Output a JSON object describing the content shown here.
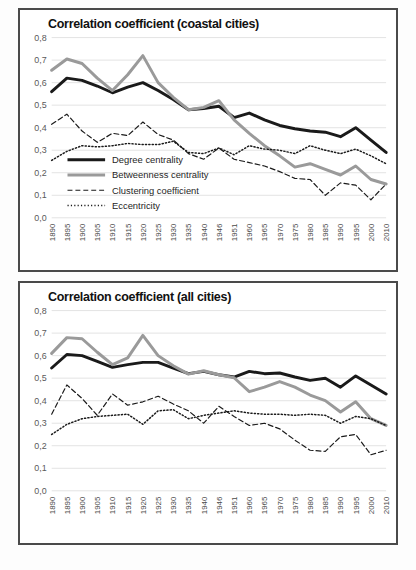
{
  "page": {
    "background": "#fdfdfd",
    "panel_border_color": "#4a4a4a"
  },
  "colors": {
    "degree": "#1a1a1a",
    "betweenness": "#9a9a9a",
    "clustering": "#1a1a1a",
    "eccentricity": "#1a1a1a",
    "grid": "#e3e3e3",
    "axis_text": "#5a5a5a"
  },
  "legend": {
    "items": [
      {
        "label": "Degree centrality",
        "style": "solid-thick",
        "color": "#1a1a1a"
      },
      {
        "label": "Betweenness centrality",
        "style": "solid-thick",
        "color": "#9a9a9a"
      },
      {
        "label": "Clustering coefficient",
        "style": "dashed",
        "color": "#1a1a1a"
      },
      {
        "label": "Eccentricity",
        "style": "dotted",
        "color": "#1a1a1a"
      }
    ]
  },
  "chart_data": [
    {
      "type": "line",
      "title": "Correlation coefficient (coastal cities)",
      "xlabel": "",
      "ylabel": "",
      "ylim": [
        0.0,
        0.8
      ],
      "yticks": [
        0.0,
        0.1,
        0.2,
        0.3,
        0.4,
        0.5,
        0.6,
        0.7,
        0.8
      ],
      "ytick_labels": [
        "0,0",
        "0,1",
        "0,2",
        "0,3",
        "0,4",
        "0,5",
        "0,6",
        "0,7",
        "0,8"
      ],
      "grid": true,
      "legend_position": "inside-lower-left",
      "categories": [
        "1890",
        "1895",
        "1900",
        "1905",
        "1910",
        "1915",
        "1920",
        "1925",
        "1930",
        "1935",
        "1940",
        "1946",
        "1951",
        "1960",
        "1965",
        "1970",
        "1975",
        "1980",
        "1985",
        "1990",
        "1995",
        "2000",
        "2010"
      ],
      "series": [
        {
          "name": "Degree centrality",
          "values": [
            0.56,
            0.62,
            0.61,
            0.585,
            0.555,
            0.58,
            0.6,
            0.565,
            0.525,
            0.48,
            0.485,
            0.495,
            0.445,
            0.465,
            0.435,
            0.41,
            0.395,
            0.385,
            0.38,
            0.36,
            0.4,
            0.345,
            0.29
          ]
        },
        {
          "name": "Betweenness centrality",
          "values": [
            0.655,
            0.705,
            0.685,
            0.62,
            0.565,
            0.635,
            0.72,
            0.6,
            0.535,
            0.48,
            0.49,
            0.52,
            0.435,
            0.375,
            0.32,
            0.275,
            0.225,
            0.24,
            0.215,
            0.19,
            0.23,
            0.17,
            0.15
          ]
        },
        {
          "name": "Clustering coefficient",
          "values": [
            0.415,
            0.46,
            0.385,
            0.335,
            0.375,
            0.365,
            0.425,
            0.37,
            0.345,
            0.285,
            0.26,
            0.31,
            0.26,
            0.245,
            0.23,
            0.205,
            0.175,
            0.17,
            0.1,
            0.155,
            0.145,
            0.08,
            0.15
          ]
        },
        {
          "name": "Eccentricity",
          "values": [
            0.255,
            0.295,
            0.32,
            0.315,
            0.32,
            0.33,
            0.325,
            0.325,
            0.34,
            0.29,
            0.285,
            0.31,
            0.28,
            0.32,
            0.305,
            0.3,
            0.285,
            0.32,
            0.3,
            0.285,
            0.305,
            0.275,
            0.24
          ]
        }
      ]
    },
    {
      "type": "line",
      "title": "Correlation coefficient (all cities)",
      "xlabel": "",
      "ylabel": "",
      "ylim": [
        0.0,
        0.8
      ],
      "yticks": [
        0.0,
        0.1,
        0.2,
        0.3,
        0.4,
        0.5,
        0.6,
        0.7,
        0.8
      ],
      "ytick_labels": [
        "0,0",
        "0,1",
        "0,2",
        "0,3",
        "0,4",
        "0,5",
        "0,6",
        "0,7",
        "0,8"
      ],
      "grid": true,
      "legend_position": "none",
      "categories": [
        "1890",
        "1895",
        "1900",
        "1905",
        "1910",
        "1915",
        "1920",
        "1925",
        "1930",
        "1935",
        "1940",
        "1946",
        "1951",
        "1960",
        "1965",
        "1970",
        "1975",
        "1980",
        "1985",
        "1990",
        "1995",
        "2000",
        "2010"
      ],
      "series": [
        {
          "name": "Degree centrality",
          "values": [
            0.545,
            0.605,
            0.6,
            0.575,
            0.548,
            0.56,
            0.57,
            0.57,
            0.545,
            0.52,
            0.53,
            0.515,
            0.505,
            0.53,
            0.52,
            0.523,
            0.505,
            0.49,
            0.5,
            0.46,
            0.51,
            0.47,
            0.43
          ]
        },
        {
          "name": "Betweenness centrality",
          "values": [
            0.61,
            0.68,
            0.675,
            0.615,
            0.56,
            0.59,
            0.69,
            0.6,
            0.555,
            0.518,
            0.533,
            0.515,
            0.502,
            0.44,
            0.46,
            0.485,
            0.46,
            0.425,
            0.4,
            0.35,
            0.395,
            0.32,
            0.29
          ]
        },
        {
          "name": "Clustering coefficient",
          "values": [
            0.34,
            0.47,
            0.41,
            0.335,
            0.43,
            0.38,
            0.395,
            0.42,
            0.385,
            0.355,
            0.3,
            0.375,
            0.33,
            0.29,
            0.3,
            0.275,
            0.225,
            0.18,
            0.175,
            0.24,
            0.25,
            0.16,
            0.18
          ]
        },
        {
          "name": "Eccentricity",
          "values": [
            0.25,
            0.295,
            0.32,
            0.33,
            0.335,
            0.34,
            0.295,
            0.355,
            0.36,
            0.32,
            0.335,
            0.345,
            0.355,
            0.345,
            0.34,
            0.34,
            0.335,
            0.34,
            0.335,
            0.3,
            0.33,
            0.32,
            0.29
          ]
        }
      ]
    }
  ]
}
